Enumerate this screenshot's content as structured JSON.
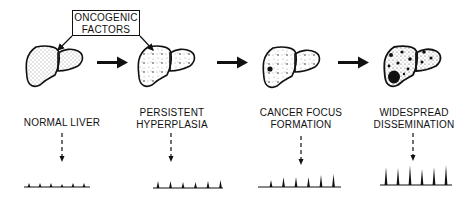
{
  "title_box": {
    "line1": "ONCOGENIC",
    "line2": "FACTORS"
  },
  "stages": [
    {
      "label_line1": "NORMAL LIVER",
      "label_line2": "",
      "texture": "fine-stipple",
      "spikes": [
        4,
        4,
        4,
        3,
        4,
        4
      ]
    },
    {
      "label_line1": "PERSISTENT",
      "label_line2": "HYPERPLASIA",
      "texture": "star-clusters",
      "spikes": [
        7,
        7,
        6,
        6,
        7,
        8
      ]
    },
    {
      "label_line1": "CANCER FOCUS",
      "label_line2": "FORMATION",
      "texture": "star-clusters-one-focus",
      "spikes": [
        7,
        10,
        10,
        10,
        12,
        13
      ]
    },
    {
      "label_line1": "WIDESPREAD",
      "label_line2": "DISSEMINATION",
      "texture": "multiple-dark-foci",
      "spikes": [
        18,
        17,
        20,
        16,
        18,
        20
      ]
    }
  ],
  "colors": {
    "ink": "#111111",
    "background": "#ffffff"
  }
}
